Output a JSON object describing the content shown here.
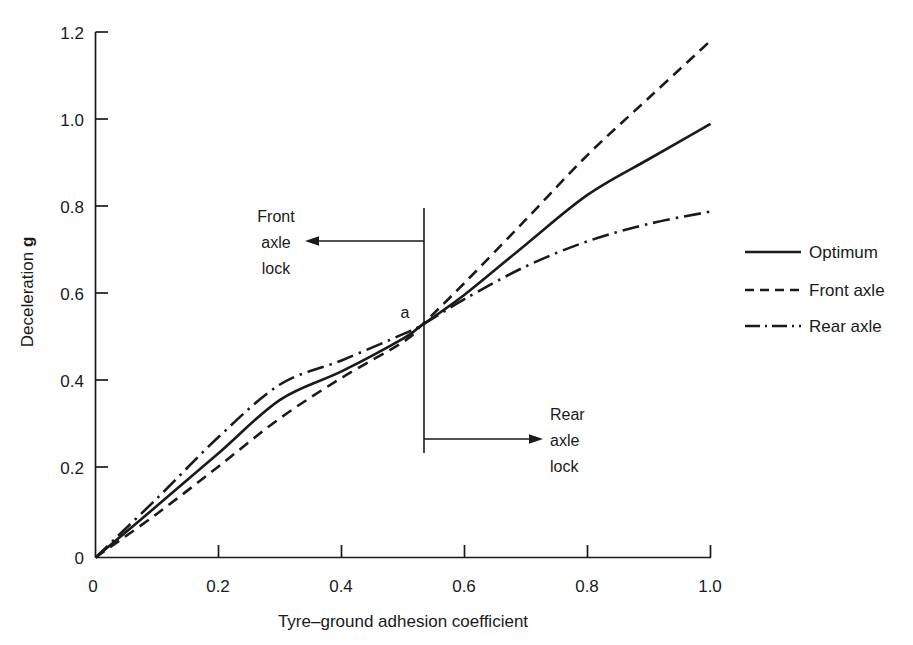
{
  "chart_data": {
    "type": "line",
    "title": "",
    "xlabel": "Tyre–ground adhesion coefficient",
    "ylabel": "Deceleration g",
    "xlim": [
      0,
      1.0
    ],
    "ylim": [
      0,
      1.2
    ],
    "xticks": [
      "0",
      "0.2",
      "0.4",
      "0.6",
      "0.8",
      "1.0"
    ],
    "xtickvalues": [
      0,
      0.2,
      0.4,
      0.6,
      0.8,
      1.0
    ],
    "yticks": [
      "0",
      "0.2",
      "0.4",
      "0.6",
      "0.8",
      "1.0",
      "1.2"
    ],
    "ytickvalues": [
      0,
      0.2,
      0.4,
      0.6,
      0.8,
      1.0,
      1.2
    ],
    "grid": false,
    "legend_position": "right",
    "x": [
      0,
      0.1,
      0.2,
      0.3,
      0.4,
      0.5,
      0.53,
      0.6,
      0.7,
      0.8,
      0.9,
      1.0
    ],
    "series": [
      {
        "name": "Optimum",
        "style": "solid",
        "values": [
          0,
          0.118,
          0.238,
          0.36,
          0.425,
          0.5,
          0.53,
          0.6,
          0.715,
          0.828,
          0.91,
          0.99
        ]
      },
      {
        "name": "Front axle",
        "style": "dashed",
        "values": [
          0,
          0.1,
          0.208,
          0.318,
          0.41,
          0.492,
          0.53,
          0.627,
          0.772,
          0.919,
          1.05,
          1.18
        ]
      },
      {
        "name": "Rear axle",
        "style": "dashdot",
        "values": [
          0,
          0.135,
          0.275,
          0.395,
          0.45,
          0.51,
          0.53,
          0.59,
          0.665,
          0.722,
          0.762,
          0.79
        ]
      }
    ],
    "annotations": [
      {
        "id": "divider",
        "type": "vline",
        "x": 0.533,
        "y_from": 0.4,
        "y_to": 1.0
      },
      {
        "id": "point-a",
        "type": "text",
        "label": "a",
        "x": 0.525,
        "y": 0.565
      },
      {
        "id": "front-axle-lock",
        "type": "arrow-label",
        "lines": [
          "Front",
          "axle",
          "lock"
        ],
        "direction": "left"
      },
      {
        "id": "rear-axle-lock",
        "type": "arrow-label",
        "lines": [
          "Rear",
          "axle",
          "lock"
        ],
        "direction": "right"
      }
    ]
  },
  "axes": {
    "y_label_main": "Deceleration ",
    "y_label_bold": "g",
    "x_label": "Tyre–ground adhesion coefficient"
  },
  "xtick_labels": {
    "t0": "0",
    "t1": "0.2",
    "t2": "0.4",
    "t3": "0.6",
    "t4": "0.8",
    "t5": "1.0"
  },
  "ytick_labels": {
    "t0": "0",
    "t1": "0.2",
    "t2": "0.4",
    "t3": "0.6",
    "t4": "0.8",
    "t5": "1.0",
    "t6": "1.2"
  },
  "annotations": {
    "front_lock": {
      "line1": "Front",
      "line2": "axle",
      "line3": "lock"
    },
    "rear_lock": {
      "line1": "Rear",
      "line2": "axle",
      "line3": "lock"
    },
    "point_a": "a"
  },
  "legend": {
    "items": [
      {
        "label": "Optimum",
        "style": "solid"
      },
      {
        "label": "Front axle",
        "style": "dashed"
      },
      {
        "label": "Rear axle",
        "style": "dashdot"
      }
    ]
  },
  "colors": {
    "ink": "#1a1a1a",
    "background": "#ffffff"
  }
}
